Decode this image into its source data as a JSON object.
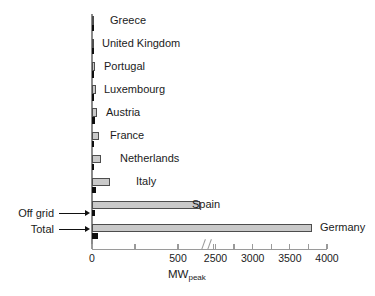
{
  "chart_data": {
    "type": "bar",
    "orientation": "horizontal",
    "title": "",
    "xlabel": "MWpeak",
    "ylabel": "",
    "axis_break": true,
    "xlim": [
      0,
      4000
    ],
    "grid": false,
    "legend_position": "left-arrows",
    "tick_labels": [
      "0",
      "500",
      "2500",
      "3000",
      "3500",
      "4000"
    ],
    "tick_values": [
      0,
      500,
      2500,
      3000,
      3500,
      4000
    ],
    "minor_tick_values": [
      250,
      2250,
      2750,
      3250,
      3750
    ],
    "categories": [
      "Greece",
      "United Kingdom",
      "Portugal",
      "Luxembourg",
      "Austria",
      "France",
      "Netherlands",
      "Italy",
      "Spain",
      "Germany"
    ],
    "series": [
      {
        "name": "Total",
        "color": "#c9c9c9",
        "values": [
          6,
          14,
          16,
          24,
          30,
          42,
          52,
          105,
          520,
          3800
        ]
      },
      {
        "name": "Off grid",
        "color": "#0d0d0d",
        "values": [
          3,
          3,
          3,
          4,
          18,
          11,
          5,
          22,
          20,
          35
        ]
      }
    ]
  },
  "axis": {
    "title_main": "MW",
    "title_sub": "peak",
    "ticks": [
      {
        "label": "0",
        "value": 0
      },
      {
        "label": "500",
        "value": 500
      },
      {
        "label": "2500",
        "value": 2500
      },
      {
        "label": "3000",
        "value": 3000
      },
      {
        "label": "3500",
        "value": 3500
      },
      {
        "label": "4000",
        "value": 4000
      }
    ]
  },
  "annotations": {
    "off_grid_label": "Off grid",
    "total_label": "Total"
  },
  "bars": [
    {
      "country": "Greece",
      "total": 6,
      "offgrid": 3
    },
    {
      "country": "United Kingdom",
      "total": 14,
      "offgrid": 3
    },
    {
      "country": "Portugal",
      "total": 16,
      "offgrid": 3
    },
    {
      "country": "Luxembourg",
      "total": 24,
      "offgrid": 4
    },
    {
      "country": "Austria",
      "total": 30,
      "offgrid": 18
    },
    {
      "country": "France",
      "total": 42,
      "offgrid": 11
    },
    {
      "country": "Netherlands",
      "total": 52,
      "offgrid": 5
    },
    {
      "country": "Italy",
      "total": 105,
      "offgrid": 22
    },
    {
      "country": "Spain",
      "total": 520,
      "offgrid": 20
    },
    {
      "country": "Germany",
      "total": 3800,
      "offgrid": 35
    }
  ],
  "caption": {
    "text": ""
  },
  "colors": {
    "total_fill": "#c9c9c9",
    "total_stroke": "#4d4d4d",
    "offgrid_fill": "#0d0d0d",
    "axis": "#9a9a9a",
    "text": "#1b1b1b"
  }
}
